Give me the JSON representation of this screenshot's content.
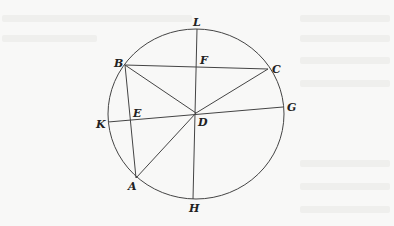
{
  "figure": {
    "type": "geometry-diagram",
    "colors": {
      "stroke": "#444444",
      "label": "#222222",
      "background": "#f8f8f7"
    },
    "circle": {
      "center": "D",
      "cx": 196,
      "cy": 114,
      "rx": 88,
      "ry": 85
    },
    "points": {
      "L": {
        "label": "L",
        "x": 197,
        "y": 29
      },
      "F": {
        "label": "F",
        "x": 197,
        "y": 68
      },
      "B": {
        "label": "B",
        "x": 125,
        "y": 65
      },
      "C": {
        "label": "C",
        "x": 268,
        "y": 69
      },
      "G": {
        "label": "G",
        "x": 283,
        "y": 107
      },
      "E": {
        "label": "E",
        "x": 131,
        "y": 120
      },
      "K": {
        "label": "K",
        "x": 108,
        "y": 122
      },
      "D": {
        "label": "D",
        "x": 196,
        "y": 113
      },
      "A": {
        "label": "A",
        "x": 136,
        "y": 178
      },
      "H": {
        "label": "H",
        "x": 193,
        "y": 199
      }
    },
    "segments": [
      "BC",
      "BA",
      "BD",
      "CD",
      "LH",
      "KG",
      "AD"
    ]
  }
}
